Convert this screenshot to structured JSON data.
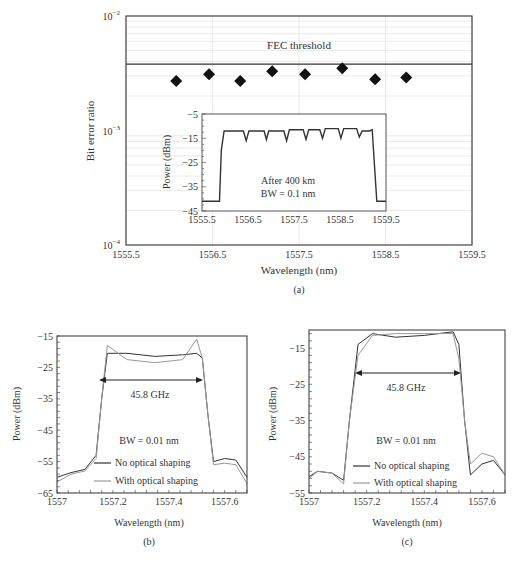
{
  "chart_data": [
    {
      "id": "a",
      "type": "scatter",
      "caption": "(a)",
      "xlabel": "Wavelength (nm)",
      "ylabel": "Bit error ratio",
      "yscale": "log",
      "xlim": [
        1555.5,
        1559.5
      ],
      "ylim": [
        0.0001,
        0.01
      ],
      "xticks": [
        "1555.5",
        "1556.5",
        "1557.5",
        "1558.5",
        "1559.5"
      ],
      "yticks": [
        {
          "base": "10",
          "exp": "−2"
        },
        {
          "base": "10",
          "exp": "−3"
        },
        {
          "base": "10",
          "exp": "−4"
        }
      ],
      "grid": true,
      "threshold": {
        "label": "FEC threshold",
        "value": 0.0038
      },
      "series": [
        {
          "name": "BER",
          "marker": "diamond",
          "x": [
            1556.08,
            1556.46,
            1556.82,
            1557.19,
            1557.57,
            1558.0,
            1558.38,
            1558.74
          ],
          "y": [
            0.0027,
            0.0031,
            0.0027,
            0.0033,
            0.0031,
            0.0035,
            0.0028,
            0.0029
          ]
        }
      ],
      "inset": {
        "type": "line",
        "xlabel": "",
        "ylabel": "Power (dBm)",
        "xlim": [
          1555.5,
          1559.5
        ],
        "ylim": [
          -45,
          -5
        ],
        "xticks": [
          "1555.5",
          "1556.5",
          "1557.5",
          "1558.5",
          "1559.5"
        ],
        "yticks": [
          "−5",
          "−15",
          "−25",
          "−35",
          "−45"
        ],
        "annotation_lines": [
          "After 400 km",
          "BW = 0.1 nm"
        ],
        "series": [
          {
            "name": "spectrum",
            "x": [
              1555.5,
              1555.88,
              1555.92,
              1555.98,
              1556.4,
              1556.46,
              1556.52,
              1556.85,
              1556.9,
              1556.95,
              1557.28,
              1557.34,
              1557.4,
              1557.7,
              1557.76,
              1557.82,
              1558.06,
              1558.12,
              1558.18,
              1558.46,
              1558.52,
              1558.58,
              1558.86,
              1558.92,
              1558.98,
              1559.14,
              1559.2,
              1559.3,
              1559.5
            ],
            "y": [
              -41,
              -41,
              -20,
              -12,
              -12,
              -16,
              -12,
              -12,
              -15.5,
              -12,
              -12,
              -16,
              -11.5,
              -11.5,
              -15.5,
              -11.5,
              -11.5,
              -15,
              -11,
              -11,
              -15,
              -11,
              -11,
              -14.5,
              -12,
              -12,
              -11.5,
              -41,
              -41
            ]
          }
        ]
      }
    },
    {
      "id": "b",
      "type": "line",
      "caption": "(b)",
      "xlabel": "Wavelength (nm)",
      "ylabel": "Power (dBm)",
      "xlim": [
        1557.0,
        1557.68
      ],
      "ylim": [
        -65,
        -15
      ],
      "xticks": [
        "1557",
        "1557.2",
        "1557.4",
        "1557.6"
      ],
      "yticks": [
        "−15",
        "−25",
        "−35",
        "−45",
        "−55",
        "−65"
      ],
      "annotations": {
        "bandwidth": "45.8 GHz",
        "resolution": "BW = 0.01 nm"
      },
      "legend": [
        "No optical shaping",
        "With optical shaping"
      ],
      "series": [
        {
          "name": "No optical shaping",
          "x": [
            1557.0,
            1557.05,
            1557.1,
            1557.14,
            1557.16,
            1557.18,
            1557.25,
            1557.35,
            1557.45,
            1557.5,
            1557.52,
            1557.54,
            1557.56,
            1557.6,
            1557.64,
            1557.68
          ],
          "y": [
            -60,
            -58.5,
            -57.5,
            -53,
            -35,
            -20.5,
            -20.5,
            -21.5,
            -21,
            -20.5,
            -22,
            -40,
            -55,
            -54,
            -54.5,
            -60
          ]
        },
        {
          "name": "With optical shaping",
          "x": [
            1557.0,
            1557.05,
            1557.1,
            1557.14,
            1557.16,
            1557.18,
            1557.25,
            1557.35,
            1557.45,
            1557.5,
            1557.52,
            1557.54,
            1557.56,
            1557.6,
            1557.64,
            1557.68
          ],
          "y": [
            -61.5,
            -59,
            -58,
            -54,
            -35,
            -18,
            -22.5,
            -23.5,
            -22.5,
            -16,
            -22,
            -40,
            -56,
            -55.5,
            -56,
            -62
          ]
        }
      ]
    },
    {
      "id": "c",
      "type": "line",
      "caption": "(c)",
      "xlabel": "Wavelength (nm)",
      "ylabel": "Power (dBm)",
      "xlim": [
        1557.0,
        1557.68
      ],
      "ylim": [
        -55,
        -10
      ],
      "xticks": [
        "1557",
        "1557.2",
        "1557.4",
        "1557.6"
      ],
      "yticks": [
        "−15",
        "−25",
        "−35",
        "−45",
        "−55"
      ],
      "annotations": {
        "bandwidth": "45.8 GHz",
        "resolution": "BW = 0.01 nm"
      },
      "legend": [
        "No optical shaping",
        "With optical shaping"
      ],
      "series": [
        {
          "name": "No optical shaping",
          "x": [
            1557.0,
            1557.03,
            1557.08,
            1557.12,
            1557.14,
            1557.17,
            1557.22,
            1557.3,
            1557.4,
            1557.5,
            1557.52,
            1557.54,
            1557.56,
            1557.6,
            1557.64,
            1557.68
          ],
          "y": [
            -50.5,
            -49,
            -49.5,
            -51.5,
            -35,
            -14,
            -11,
            -12,
            -11.5,
            -10.5,
            -14,
            -35,
            -50,
            -47,
            -46,
            -50
          ]
        },
        {
          "name": "With optical shaping",
          "x": [
            1557.0,
            1557.03,
            1557.08,
            1557.12,
            1557.14,
            1557.17,
            1557.22,
            1557.3,
            1557.4,
            1557.5,
            1557.52,
            1557.54,
            1557.56,
            1557.6,
            1557.64,
            1557.68
          ],
          "y": [
            -51,
            -49,
            -49.5,
            -52.5,
            -35,
            -17,
            -11.5,
            -11,
            -11,
            -11,
            -18,
            -35,
            -47,
            -44,
            -45,
            -50
          ]
        }
      ]
    }
  ]
}
